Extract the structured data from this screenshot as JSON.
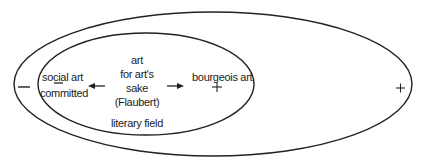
{
  "diagram": {
    "outer_ellipse": {
      "label": "",
      "left_sign": "−",
      "right_sign": "+"
    },
    "inner_ellipse": {
      "label": "literary field"
    },
    "nodes": {
      "left_top": "social art",
      "left_bottom": "committed",
      "center_lines": [
        "art",
        "for art's",
        "sake",
        "(Flaubert)"
      ],
      "right": "bourgeois art"
    },
    "signs": {
      "social_art_minus": "−",
      "bourgeois_plus": "+"
    },
    "arrows": {
      "left": "←",
      "right": "→"
    },
    "stroke_color": "#222222"
  }
}
